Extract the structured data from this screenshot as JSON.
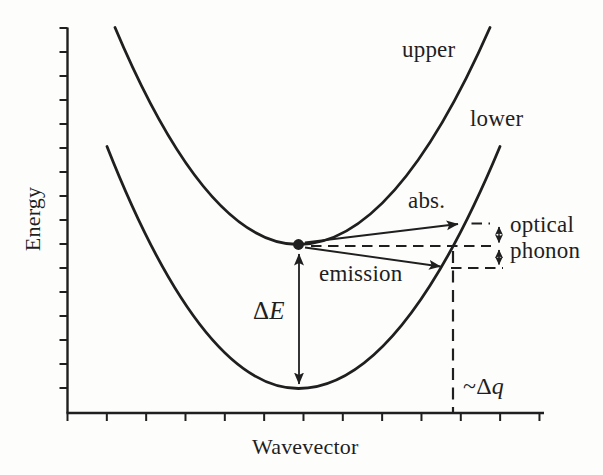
{
  "diagram": {
    "y_axis_label": "Energy",
    "x_axis_label": "Wavevector",
    "bands": {
      "upper_label": "upper",
      "lower_label": "lower"
    },
    "transitions": {
      "absorption_label": "abs.",
      "emission_label": "emission"
    },
    "phonon": {
      "line1": "optical",
      "line2": "phonon"
    },
    "energy_gap": {
      "delta": "Δ",
      "symbol": "E"
    },
    "wavevector_change": {
      "prefix": "~Δ",
      "symbol": "q"
    }
  },
  "colors": {
    "ink": "#1f1f1f",
    "background": "#fdfdfc"
  }
}
